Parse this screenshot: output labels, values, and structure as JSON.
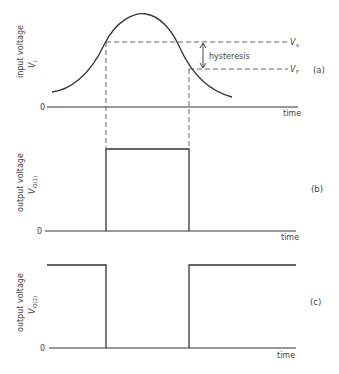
{
  "panels": [
    {
      "id": "a",
      "part_label": "(a)",
      "ylabel": "input voltage",
      "ysymbol": "V",
      "ysymbol_sub": "I",
      "zero_label": "0",
      "xlabel": "time",
      "thresholds": [
        {
          "label": "V",
          "sub": "s",
          "name": "upper threshold"
        },
        {
          "label": "V",
          "sub": "F",
          "name": "lower threshold"
        }
      ],
      "annotation": "hysteresis"
    },
    {
      "id": "b",
      "part_label": "(b)",
      "ylabel": "output voltage",
      "ysymbol": "V",
      "ysymbol_sub": "O(1)",
      "zero_label": "0",
      "xlabel": "time"
    },
    {
      "id": "c",
      "part_label": "(c)",
      "ylabel": "output voltage",
      "ysymbol": "V",
      "ysymbol_sub": "O(2)",
      "zero_label": "0",
      "xlabel": "time"
    }
  ],
  "colors": {
    "line": "#333333",
    "dashed": "#555555",
    "background": "#ffffff"
  }
}
